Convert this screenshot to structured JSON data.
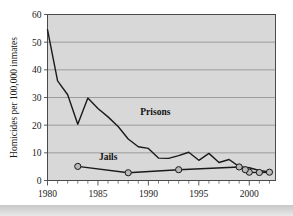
{
  "chart_data": {
    "type": "line",
    "title": "",
    "xlabel": "",
    "ylabel": "Homicides per 100,000 inmates",
    "xlim": [
      1980,
      2002.6
    ],
    "ylim": [
      0,
      60
    ],
    "yticks": [
      0,
      10,
      20,
      30,
      40,
      50,
      60
    ],
    "ytick_labels": [
      "0",
      "10",
      "20",
      "30",
      "40",
      "50",
      "60"
    ],
    "xticks": [
      1980,
      1985,
      1990,
      1995,
      2000
    ],
    "xtick_labels": [
      "1980",
      "1985",
      "1990",
      "1995",
      "2000"
    ],
    "x_minor_tick_step": 1,
    "grid": "horizontal",
    "legend_position": "inline-annotation",
    "plot_background": "#d8d8d8",
    "line_color": "#1a1a1a",
    "marker_fill": "#b8b8b8",
    "series": [
      {
        "name": "Prisons",
        "label": "Prisons",
        "label_x": 1989.2,
        "label_y": 23.5,
        "markers": false,
        "x": [
          1980,
          1981,
          1982,
          1983,
          1984,
          1985,
          1986,
          1987,
          1988,
          1989,
          1990,
          1991,
          1992,
          1993,
          1994,
          1995,
          1996,
          1997,
          1998,
          1999,
          2000,
          2001,
          2002
        ],
        "values": [
          54.5,
          36.0,
          31.0,
          20.3,
          29.8,
          26.0,
          23.0,
          19.5,
          15.0,
          12.2,
          11.6,
          8.1,
          8.0,
          9.0,
          10.2,
          7.3,
          9.8,
          6.5,
          7.6,
          5.0,
          4.6,
          3.6,
          3.1
        ]
      },
      {
        "name": "Jails",
        "label": "Jails",
        "label_x": 1985.1,
        "label_y": 7.3,
        "markers": true,
        "x": [
          1983,
          1988,
          1993,
          1999,
          2000,
          2001,
          2002
        ],
        "values": [
          5.1,
          2.8,
          3.9,
          4.9,
          3.0,
          2.9,
          3.0
        ],
        "extra_markers": [
          {
            "x": 1999.6,
            "y": 3.9
          }
        ]
      }
    ]
  },
  "annotations": {
    "prisons_label": "Prisons",
    "jails_label": "Jails"
  }
}
